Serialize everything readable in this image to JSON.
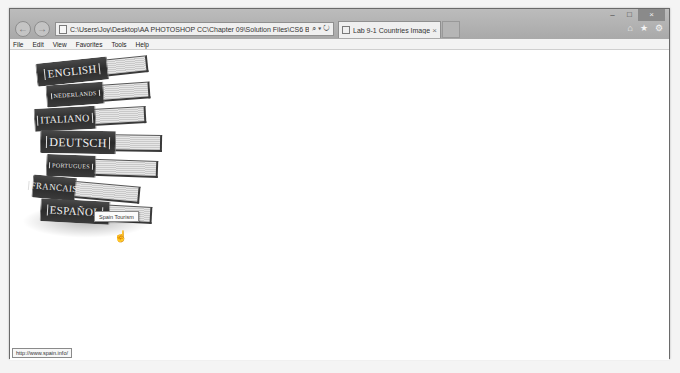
{
  "browser": {
    "address_url": "C:\\Users\\Joy\\Desktop\\AA PHOTOSHOP CC\\Chapter 09\\Solution Files\\CS6 Book\\Chapter 09\\Image",
    "address_tools": "⌕ ▾ ↻",
    "tab_title": "Lab 9-1 Countries Image M...",
    "tab_close": "×",
    "back_glyph": "←",
    "forward_glyph": "→",
    "window_controls": {
      "minimize": "–",
      "maximize": "□",
      "close": "×"
    },
    "right_icons": {
      "home": "⌂",
      "favorites": "★",
      "settings": "⚙"
    }
  },
  "menu": {
    "items": [
      "File",
      "Edit",
      "View",
      "Favorites",
      "Tools",
      "Help"
    ]
  },
  "image_map": {
    "books": [
      {
        "label": "ENGLISH"
      },
      {
        "label": "NEDERLANDS"
      },
      {
        "label": "ITALIANO"
      },
      {
        "label": "DEUTSCH"
      },
      {
        "label": "PORTUGUES"
      },
      {
        "label": "FRANCAIS"
      },
      {
        "label": "ESPAÑOL"
      }
    ],
    "tooltip": "Spain Tourism",
    "cursor_glyph": "☝"
  },
  "status_bar": {
    "url": "http://www.spain.info/"
  }
}
